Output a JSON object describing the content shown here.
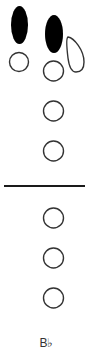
{
  "fingering_chart": {
    "note": "B♭",
    "colors": {
      "closed": "#000000",
      "open_stroke": "#333333",
      "open_fill": "#ffffff",
      "divider": "#1a1a1a"
    },
    "thumb_keys": [
      {
        "name": "left-thumb-key",
        "state": "closed"
      },
      {
        "name": "right-thumb-key",
        "state": "closed"
      },
      {
        "name": "octave-key",
        "state": "open"
      }
    ],
    "upper_holes": [
      {
        "name": "thumb-hole",
        "state": "open"
      },
      {
        "name": "hole-1",
        "state": "open"
      },
      {
        "name": "hole-2",
        "state": "open"
      },
      {
        "name": "hole-3",
        "state": "open"
      }
    ],
    "lower_holes": [
      {
        "name": "hole-4",
        "state": "open"
      },
      {
        "name": "hole-5",
        "state": "open"
      },
      {
        "name": "hole-6",
        "state": "open"
      }
    ]
  }
}
